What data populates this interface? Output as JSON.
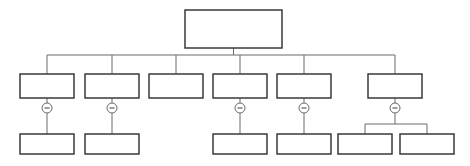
{
  "diagram": {
    "type": "org-chart",
    "colors": {
      "node_border": "#3a3a3a",
      "edge": "#6a6a6a",
      "background": "#ffffff"
    },
    "root": {
      "id": "root",
      "label": "",
      "children": [
        {
          "id": "a",
          "label": "",
          "collapse_toggle": "collapse-icon",
          "children": [
            {
              "id": "a1",
              "label": ""
            }
          ]
        },
        {
          "id": "b",
          "label": "",
          "collapse_toggle": "collapse-icon",
          "children": [
            {
              "id": "b1",
              "label": ""
            }
          ]
        },
        {
          "id": "c",
          "label": "",
          "children": []
        },
        {
          "id": "d",
          "label": "",
          "collapse_toggle": "collapse-icon",
          "children": [
            {
              "id": "d1",
              "label": ""
            }
          ]
        },
        {
          "id": "e",
          "label": "",
          "collapse_toggle": "collapse-icon",
          "children": [
            {
              "id": "e1",
              "label": ""
            }
          ]
        },
        {
          "id": "f",
          "label": "",
          "collapse_toggle": "collapse-icon",
          "children": [
            {
              "id": "f1",
              "label": ""
            },
            {
              "id": "f2",
              "label": ""
            }
          ]
        }
      ]
    }
  }
}
